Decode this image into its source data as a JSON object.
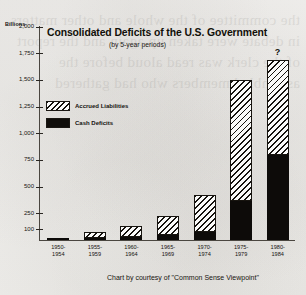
{
  "chart_data": {
    "type": "bar",
    "subtype": "stacked",
    "title": "Consolidated Deficits of the U.S. Government",
    "subtitle": "(by 5-year periods)",
    "xlabel": "",
    "ylabel": "Billions",
    "ylim": [
      0,
      2000
    ],
    "grid": false,
    "legend_position": "inside-upper-left",
    "ytick_labels": [
      "2,000",
      "1,750",
      "1,500",
      "1,250",
      "1,000",
      "750",
      "500",
      "250",
      "100"
    ],
    "ytick_values": [
      2000,
      1750,
      1500,
      1250,
      1000,
      750,
      500,
      250,
      100
    ],
    "categories": [
      "1950-\n1954",
      "1955-\n1959",
      "1960-\n1964",
      "1965-\n1969",
      "1970-\n1974",
      "1975-\n1979",
      "1980-\n1984"
    ],
    "series": [
      {
        "name": "Cash Deficits",
        "fill": "solid-black",
        "values": [
          20,
          25,
          35,
          55,
          75,
          370,
          800
        ]
      },
      {
        "name": "Accrued Liabilities",
        "fill": "hatched",
        "values": [
          0,
          55,
          105,
          175,
          355,
          1130,
          890
        ]
      }
    ],
    "totals": [
      20,
      80,
      140,
      230,
      430,
      1500,
      1690
    ],
    "annotations": [
      {
        "text": "?",
        "category": "1980-\n1984",
        "position": "above-bar"
      }
    ],
    "credit": "Chart by courtesy of \"Common Sense Viewpoint\""
  },
  "legend": {
    "items": [
      {
        "label": "Accrued Liabilities",
        "swatch": "hatched"
      },
      {
        "label": "Cash Deficits",
        "swatch": "solid-black"
      }
    ]
  },
  "colors": {
    "ink": "#14110d",
    "paper": "#f2f1ef",
    "cash": "#0d0b09",
    "accrued_fill": "#fbfbfa"
  },
  "ghost_text": "the committee of the whole and other matters in debate were taken up again and the report of the clerk was read aloud before the assembled members who had gathered"
}
